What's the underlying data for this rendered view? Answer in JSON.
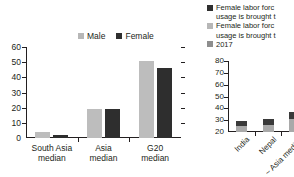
{
  "chart_data": [
    {
      "type": "bar",
      "id": "left-main-chart",
      "title": "",
      "xlabel": "",
      "ylabel": "",
      "categories": [
        "South Asia median",
        "Asia median",
        "G20 median"
      ],
      "category_lines": [
        [
          "South Asia",
          "median"
        ],
        [
          "Asia",
          "median"
        ],
        [
          "G20",
          "median"
        ]
      ],
      "series": [
        {
          "name": "Male",
          "color": "#bdbdbd",
          "values": [
            4,
            19,
            51
          ]
        },
        {
          "name": "Female",
          "color": "#2e2e2e",
          "values": [
            2,
            19,
            46
          ]
        }
      ],
      "ylim": [
        0,
        60
      ],
      "yticks": [
        0,
        10,
        20,
        30,
        40,
        50,
        60
      ],
      "ytick_labels": [
        "0",
        "10",
        "20",
        "30",
        "40",
        "50",
        "60"
      ],
      "grid": false,
      "legend_position": "top-right",
      "right_axis_ticks": true
    },
    {
      "type": "bar",
      "id": "right-chart",
      "title": "",
      "xlabel": "",
      "ylabel": "",
      "categories": [
        "India",
        "Nepal",
        "~ Asia median"
      ],
      "series": [
        {
          "name": "2017",
          "color": "#a9a9a9",
          "values": [
            25,
            26,
            31
          ]
        },
        {
          "name": "Female labor force (brought to parity)",
          "color": "#3a3a3a",
          "values": [
            29,
            31,
            37
          ]
        }
      ],
      "ylim": [
        20,
        80
      ],
      "yticks": [
        20,
        30,
        40,
        50,
        60,
        70,
        80
      ],
      "ytick_labels": [
        "20",
        "30",
        "40",
        "50",
        "60",
        "70",
        "80"
      ],
      "grid": false,
      "legend_position": "top"
    }
  ],
  "main": {
    "legend": [
      {
        "label": "Male",
        "swatch": "sw-light",
        "icon": "legend-swatch-icon"
      },
      {
        "label": "Female",
        "swatch": "sw-dark",
        "icon": "legend-swatch-icon"
      }
    ]
  },
  "right": {
    "legend": [
      {
        "line1": "Female labor forc",
        "line2": "usage is brought t",
        "swatch": "sw-dark"
      },
      {
        "line1": "Female labor forc",
        "line2": "usage is brought t",
        "swatch": "sw-light"
      },
      {
        "line1": "2017",
        "line2": "",
        "swatch": "sw-mid"
      }
    ]
  }
}
